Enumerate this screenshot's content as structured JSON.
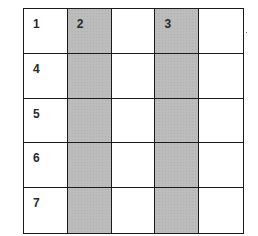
{
  "grid": {
    "rows": 5,
    "cols": 5,
    "shaded_columns": [
      2,
      4
    ],
    "colors": {
      "line": "#1a1a1a",
      "shaded": "#bcbcbc",
      "blank": "#ffffff"
    },
    "cells": [
      [
        "1",
        "2",
        "",
        "3",
        ""
      ],
      [
        "4",
        "",
        "",
        "",
        ""
      ],
      [
        "5",
        "",
        "",
        "",
        ""
      ],
      [
        "6",
        "",
        "",
        "",
        ""
      ],
      [
        "7",
        "",
        "",
        "",
        ""
      ]
    ]
  }
}
